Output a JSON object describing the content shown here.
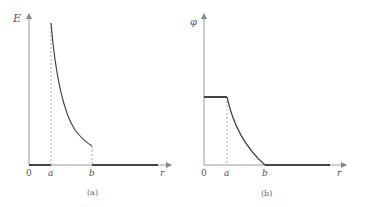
{
  "figure": {
    "panels": [
      {
        "id": "a",
        "caption": "(a)",
        "y_label": "E",
        "x_label": "r",
        "origin_label": "0",
        "x_ticks": [
          "a",
          "b"
        ],
        "description": "E is zero for r<a, jumps at r=a and decays ~1/r^2 to r=b, then drops to zero for r>b"
      },
      {
        "id": "b",
        "caption": "(b)",
        "y_label": "φ",
        "x_label": "r",
        "origin_label": "0",
        "x_ticks": [
          "a",
          "b"
        ],
        "description": "φ is constant for r<a, decreases from r=a to zero at r=b, then zero for r>b"
      }
    ]
  },
  "colors": {
    "axis": "#888888",
    "curve": "#444444",
    "dashed": "#999999"
  }
}
